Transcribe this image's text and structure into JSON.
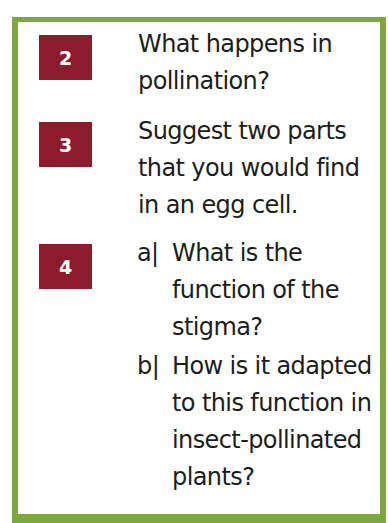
{
  "colors": {
    "border": "#7ea83a",
    "badge": "#8c1b2c",
    "text": "#1d1d1b"
  },
  "questions": [
    {
      "number": "2",
      "text": "What happens in pollination?"
    },
    {
      "number": "3",
      "text": "Suggest two parts that you would find in an egg cell."
    },
    {
      "number": "4",
      "parts": [
        {
          "label": "a|",
          "text": "What is the function of the stigma?"
        },
        {
          "label": "b|",
          "text": "How is it adapted to this function in insect-pollinated plants?"
        }
      ]
    }
  ]
}
